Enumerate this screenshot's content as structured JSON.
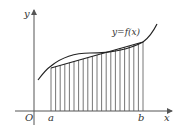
{
  "diagram": {
    "type": "riemann-trapezoid-approximation",
    "labels": {
      "y_axis": "y",
      "x_axis": "x",
      "origin": "O",
      "a": "a",
      "b": "b",
      "function": "y=f(x)"
    },
    "subdivisions": 20,
    "colors": {
      "axis": "#555555",
      "curve": "#222222",
      "strips": "#666666"
    }
  }
}
